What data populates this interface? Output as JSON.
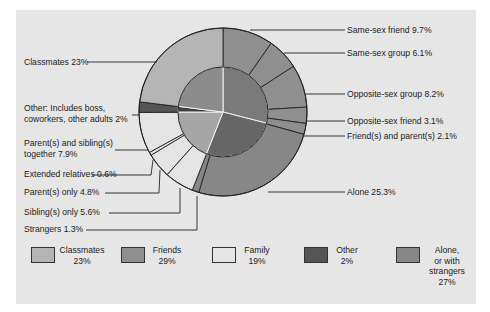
{
  "chart_data": {
    "type": "pie",
    "title": "",
    "subtype": "nested-donut",
    "inner": [
      {
        "name": "Friends",
        "value": 29,
        "color": "#8f8f8f"
      },
      {
        "name": "Alone, or with strangers",
        "value": 27,
        "color": "#878787"
      },
      {
        "name": "Family",
        "value": 19,
        "color": "#e4e4e4"
      },
      {
        "name": "Other",
        "value": 2,
        "color": "#555555"
      },
      {
        "name": "Classmates",
        "value": 23,
        "color": "#b5b5b5"
      }
    ],
    "outer": [
      {
        "name": "Same-sex friend",
        "value": 9.7,
        "group": "Friends"
      },
      {
        "name": "Same-sex group",
        "value": 6.1,
        "group": "Friends"
      },
      {
        "name": "Opposite-sex group",
        "value": 8.2,
        "group": "Friends"
      },
      {
        "name": "Opposite-sex friend",
        "value": 3.1,
        "group": "Friends"
      },
      {
        "name": "Friend(s) and parent(s)",
        "value": 2.1,
        "group": "Friends"
      },
      {
        "name": "Alone",
        "value": 25.3,
        "group": "Alone, or with strangers"
      },
      {
        "name": "Strangers",
        "value": 1.3,
        "group": "Alone, or with strangers"
      },
      {
        "name": "Sibling(s) only",
        "value": 5.6,
        "group": "Family"
      },
      {
        "name": "Parent(s) only",
        "value": 4.8,
        "group": "Family"
      },
      {
        "name": "Extended relatives",
        "value": 0.6,
        "group": "Family"
      },
      {
        "name": "Parent(s) and sibling(s) together",
        "value": 7.9,
        "group": "Family"
      },
      {
        "name": "Other: Includes boss, coworkers, other adults",
        "value": 2,
        "group": "Other"
      },
      {
        "name": "Classmates",
        "value": 23,
        "group": "Classmates"
      }
    ],
    "legend_position": "bottom"
  },
  "labels": {
    "classmates": "Classmates 23%",
    "other_line1": "Other:  Includes boss,",
    "other_line2": "coworkers, other adults 2%",
    "parents_siblings_line1": "Parent(s) and sibling(s)",
    "parents_siblings_line2": "together 7.9%",
    "extended": "Extended relatives 0.6%",
    "parents_only": "Parent(s) only 4.8%",
    "siblings_only": "Sibling(s) only 5.6%",
    "strangers": "Strangers 1.3%",
    "same_sex_friend": "Same-sex friend 9.7%",
    "same_sex_group": "Same-sex group 6.1%",
    "opposite_sex_group": "Opposite-sex group 8.2%",
    "opposite_sex_friend": "Opposite-sex friend 3.1%",
    "friends_parents": "Friend(s) and parent(s) 2.1%",
    "alone": "Alone 25.3%"
  },
  "legend": [
    {
      "line1": "Classmates",
      "line2": "23%",
      "line3": "",
      "line4": "",
      "color": "#b5b5b5"
    },
    {
      "line1": "Friends",
      "line2": "29%",
      "line3": "",
      "line4": "",
      "color": "#8f8f8f"
    },
    {
      "line1": "Family",
      "line2": "19%",
      "line3": "",
      "line4": "",
      "color": "#e4e4e4"
    },
    {
      "line1": "Other",
      "line2": "2%",
      "line3": "",
      "line4": "",
      "color": "#555555"
    },
    {
      "line1": "Alone,",
      "line2": "or with",
      "line3": "strangers",
      "line4": "27%",
      "color": "#878787"
    }
  ]
}
